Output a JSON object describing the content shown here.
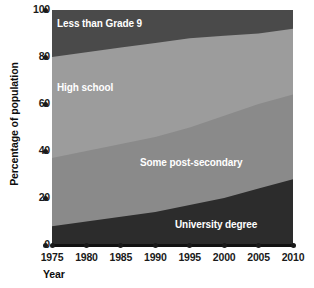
{
  "chart_data": {
    "type": "area",
    "title": "",
    "subtitle": "",
    "xlabel": "Year",
    "ylabel": "Percentage of population",
    "xlim": [
      1975,
      2010
    ],
    "ylim": [
      0,
      100
    ],
    "grid": false,
    "legend_position": "inline-labels",
    "stacked": true,
    "stack_order": "top-to-bottom",
    "x": [
      1975,
      1980,
      1985,
      1990,
      1995,
      2000,
      2005,
      2010
    ],
    "xticks": [
      "1975",
      "1980",
      "1985",
      "1990",
      "1995",
      "2000",
      "2005",
      "2010"
    ],
    "yticks": [
      "0",
      "20",
      "40",
      "60",
      "80",
      "100"
    ],
    "ytick_values": [
      0,
      20,
      40,
      60,
      80,
      100
    ],
    "series": [
      {
        "name": "University degree",
        "color": "#2c2c2c",
        "values": [
          8,
          10,
          12,
          14,
          17,
          20,
          24,
          28
        ],
        "label_text": "University degree"
      },
      {
        "name": "Some post-secondary",
        "color": "#8a8a8a",
        "values": [
          29,
          30,
          31,
          32,
          33,
          35,
          36,
          36
        ],
        "label_text": "Some post-secondary"
      },
      {
        "name": "High school",
        "color": "#9c9c9c",
        "values": [
          43,
          42,
          41,
          40,
          38,
          34,
          30,
          28
        ],
        "label_text": "High school"
      },
      {
        "name": "Less than Grade 9",
        "color": "#4a4a4a",
        "values": [
          20,
          18,
          16,
          14,
          12,
          11,
          10,
          8
        ],
        "label_text": "Less than Grade 9"
      }
    ],
    "boundaries_cumulative_top": {
      "university_degree": [
        8,
        10,
        12,
        14,
        17,
        20,
        24,
        28
      ],
      "some_post_secondary": [
        37,
        40,
        43,
        46,
        50,
        55,
        60,
        64
      ],
      "high_school": [
        80,
        82,
        84,
        86,
        88,
        89,
        90,
        92
      ],
      "less_than_grade_9": [
        100,
        100,
        100,
        100,
        100,
        100,
        100,
        100
      ]
    }
  },
  "axes": {
    "y_title": "Percentage of population",
    "x_title": "Year",
    "y_ticks": [
      "100",
      "80",
      "60",
      "40",
      "20",
      "0"
    ],
    "x_ticks": [
      "1975",
      "1980",
      "1985",
      "1990",
      "1995",
      "2000",
      "2005",
      "2010"
    ]
  },
  "labels": {
    "grade9": "Less than Grade 9",
    "high_school": "High school",
    "post_secondary": "Some post-secondary",
    "university": "University degree"
  },
  "colors": {
    "background": "#ffffff",
    "band_grade9": "#4a4a4a",
    "band_high_school": "#9c9c9c",
    "band_post_secondary": "#8a8a8a",
    "band_university": "#2c2c2c",
    "axis": "#111111",
    "text": "#1a1a1a",
    "label_text": "#ffffff"
  }
}
